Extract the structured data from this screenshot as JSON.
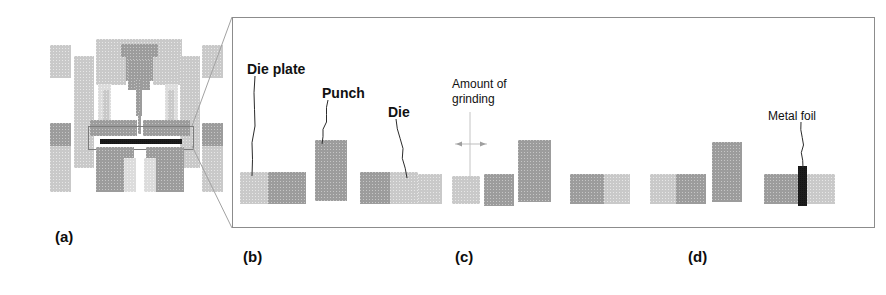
{
  "figure": {
    "caption_tags": [
      {
        "id": "a",
        "label": "(a)",
        "x": 55,
        "y": 228
      },
      {
        "id": "b",
        "label": "(b)",
        "x": 243,
        "y": 248
      },
      {
        "id": "c",
        "label": "(c)",
        "x": 455,
        "y": 248
      },
      {
        "id": "d",
        "label": "(d)",
        "x": 688,
        "y": 248
      }
    ],
    "detail_panel": {
      "x": 232,
      "y": 17,
      "width": 643,
      "height": 211
    }
  },
  "labels": [
    {
      "name": "die-plate-label",
      "text": "Die plate",
      "x": 247,
      "y": 62,
      "size": 14,
      "bold": true
    },
    {
      "name": "punch-label",
      "text": "Punch",
      "x": 322,
      "y": 86,
      "size": 14,
      "bold": true
    },
    {
      "name": "die-label",
      "text": "Die",
      "x": 388,
      "y": 105,
      "size": 14,
      "bold": true
    },
    {
      "name": "grinding-label-1",
      "text": "Amount of",
      "x": 452,
      "y": 78,
      "size": 12,
      "bold": false
    },
    {
      "name": "grinding-label-2",
      "text": "grinding",
      "x": 452,
      "y": 93,
      "size": 12,
      "bold": false
    },
    {
      "name": "metal-foil-label",
      "text": "Metal foil",
      "x": 768,
      "y": 110,
      "size": 12,
      "bold": false
    }
  ],
  "machine_a": {
    "name": "press-machine-assembly",
    "parts": [
      {
        "n": "frame-top-crossbar",
        "x": 96,
        "y": 39,
        "w": 86,
        "h": 18,
        "tone": "light"
      },
      {
        "n": "ram-head",
        "x": 121,
        "y": 44,
        "w": 37,
        "h": 37,
        "tone": "mid"
      },
      {
        "n": "punch-taper",
        "x": 128,
        "y": 60,
        "w": 22,
        "h": 30,
        "tone": "mid"
      },
      {
        "n": "punch-shank",
        "x": 136,
        "y": 80,
        "w": 6,
        "h": 36,
        "tone": "mid"
      },
      {
        "n": "punch-tip",
        "x": 138,
        "y": 112,
        "w": 3,
        "h": 22,
        "tone": "mid"
      },
      {
        "n": "upper-bolster-left",
        "x": 96,
        "y": 57,
        "w": 30,
        "h": 28,
        "tone": "light"
      },
      {
        "n": "upper-bolster-right",
        "x": 153,
        "y": 57,
        "w": 30,
        "h": 28,
        "tone": "light"
      },
      {
        "n": "column-left-outer",
        "x": 50,
        "y": 45,
        "w": 21,
        "h": 33,
        "tone": "light"
      },
      {
        "n": "column-right-outer",
        "x": 202,
        "y": 45,
        "w": 21,
        "h": 33,
        "tone": "light"
      },
      {
        "n": "column-left-mid",
        "x": 74,
        "y": 56,
        "w": 20,
        "h": 112,
        "tone": "light"
      },
      {
        "n": "column-right-mid",
        "x": 180,
        "y": 56,
        "w": 20,
        "h": 112,
        "tone": "light"
      },
      {
        "n": "guide-post-left",
        "x": 98,
        "y": 84,
        "w": 13,
        "h": 46,
        "tone": "vlight"
      },
      {
        "n": "guide-post-right",
        "x": 165,
        "y": 84,
        "w": 13,
        "h": 46,
        "tone": "vlight"
      },
      {
        "n": "spring-left",
        "x": 103,
        "y": 90,
        "w": 6,
        "h": 38,
        "tone": "light"
      },
      {
        "n": "spring-right",
        "x": 168,
        "y": 90,
        "w": 6,
        "h": 38,
        "tone": "light"
      },
      {
        "n": "die-plate-upper-left",
        "x": 90,
        "y": 120,
        "w": 47,
        "h": 16,
        "tone": "mid"
      },
      {
        "n": "die-plate-upper-right",
        "x": 143,
        "y": 120,
        "w": 47,
        "h": 16,
        "tone": "mid"
      },
      {
        "n": "tool-holder-box",
        "x": 88,
        "y": 126,
        "w": 104,
        "h": 22,
        "tone": "none"
      },
      {
        "n": "metal-foil-strip",
        "x": 100,
        "y": 139,
        "w": 82,
        "h": 5,
        "tone": "dark"
      },
      {
        "n": "lower-bolster-left",
        "x": 96,
        "y": 147,
        "w": 38,
        "h": 45,
        "tone": "mid"
      },
      {
        "n": "lower-bolster-right",
        "x": 146,
        "y": 147,
        "w": 38,
        "h": 45,
        "tone": "mid"
      },
      {
        "n": "base-plate-left",
        "x": 50,
        "y": 123,
        "w": 21,
        "h": 23,
        "tone": "mid"
      },
      {
        "n": "base-plate-right",
        "x": 202,
        "y": 123,
        "w": 21,
        "h": 23,
        "tone": "mid"
      },
      {
        "n": "base-column-left",
        "x": 50,
        "y": 146,
        "w": 21,
        "h": 46,
        "tone": "light"
      },
      {
        "n": "base-column-right",
        "x": 202,
        "y": 146,
        "w": 21,
        "h": 46,
        "tone": "light"
      },
      {
        "n": "ejector-left",
        "x": 124,
        "y": 158,
        "w": 12,
        "h": 34,
        "tone": "vlight"
      },
      {
        "n": "ejector-right",
        "x": 144,
        "y": 158,
        "w": 12,
        "h": 34,
        "tone": "vlight"
      }
    ]
  },
  "panel_b": {
    "name": "stage-b-components",
    "blocks": [
      {
        "n": "die-plate-left-half",
        "x": 240,
        "y": 172,
        "w": 28,
        "h": 32,
        "tone": "light"
      },
      {
        "n": "die-plate-right-half",
        "x": 268,
        "y": 172,
        "w": 38,
        "h": 32,
        "tone": "mid"
      },
      {
        "n": "punch-block",
        "x": 315,
        "y": 140,
        "w": 32,
        "h": 61,
        "tone": "mid"
      },
      {
        "n": "die-left-half",
        "x": 360,
        "y": 172,
        "w": 30,
        "h": 32,
        "tone": "mid"
      },
      {
        "n": "die-right-half",
        "x": 390,
        "y": 172,
        "w": 28,
        "h": 32,
        "tone": "light"
      }
    ],
    "leaders": [
      {
        "n": "die-plate-leader",
        "x1": 255,
        "y1": 76,
        "x2": 252,
        "y2": 176
      },
      {
        "n": "punch-leader",
        "x1": 328,
        "y1": 100,
        "x2": 322,
        "y2": 144
      },
      {
        "n": "die-leader",
        "x1": 396,
        "y1": 119,
        "x2": 407,
        "y2": 178
      }
    ]
  },
  "panel_c": {
    "name": "stage-c-components",
    "blocks": [
      {
        "n": "die-plate-left-c",
        "x": 418,
        "y": 174,
        "w": 24,
        "h": 30,
        "tone": "light"
      },
      {
        "n": "ground-piece-left",
        "x": 452,
        "y": 176,
        "w": 28,
        "h": 28,
        "tone": "light"
      },
      {
        "n": "ground-piece-right",
        "x": 484,
        "y": 174,
        "w": 30,
        "h": 32,
        "tone": "mid"
      },
      {
        "n": "punch-block-c",
        "x": 518,
        "y": 140,
        "w": 33,
        "h": 62,
        "tone": "mid"
      },
      {
        "n": "die-block-c",
        "x": 570,
        "y": 174,
        "w": 24,
        "h": 30,
        "tone": "light"
      }
    ],
    "dimension": {
      "n": "grinding-dimension-arrow",
      "line_x": 470,
      "line_y1": 112,
      "line_y2": 180,
      "arrow_y": 144,
      "arrow_x1": 455,
      "arrow_x2": 487
    }
  },
  "panel_d": {
    "name": "stage-d-components",
    "blocks": [
      {
        "n": "assembled-left-dark",
        "x": 570,
        "y": 174,
        "w": 34,
        "h": 30,
        "tone": "mid"
      },
      {
        "n": "assembled-left-light",
        "x": 604,
        "y": 174,
        "w": 26,
        "h": 30,
        "tone": "light"
      },
      {
        "n": "assembled-mid-light",
        "x": 650,
        "y": 174,
        "w": 26,
        "h": 30,
        "tone": "light"
      },
      {
        "n": "assembled-mid-dark",
        "x": 676,
        "y": 174,
        "w": 30,
        "h": 30,
        "tone": "mid"
      },
      {
        "n": "punch-block-d",
        "x": 712,
        "y": 142,
        "w": 30,
        "h": 60,
        "tone": "mid"
      },
      {
        "n": "final-die-left",
        "x": 764,
        "y": 174,
        "w": 34,
        "h": 30,
        "tone": "mid"
      },
      {
        "n": "metal-foil-bar",
        "x": 798,
        "y": 166,
        "w": 9,
        "h": 40,
        "tone": "dark"
      },
      {
        "n": "final-die-right",
        "x": 807,
        "y": 174,
        "w": 28,
        "h": 30,
        "tone": "light"
      }
    ],
    "leader": {
      "n": "metal-foil-leader",
      "x1": 801,
      "y1": 122,
      "x2": 803,
      "y2": 168
    }
  },
  "callout": {
    "name": "zoom-callout-lines",
    "origin_x": 192,
    "origin_top_y": 126,
    "origin_bottom_y": 146,
    "target_x": 232,
    "target_top_y": 17,
    "target_bottom_y": 228
  }
}
